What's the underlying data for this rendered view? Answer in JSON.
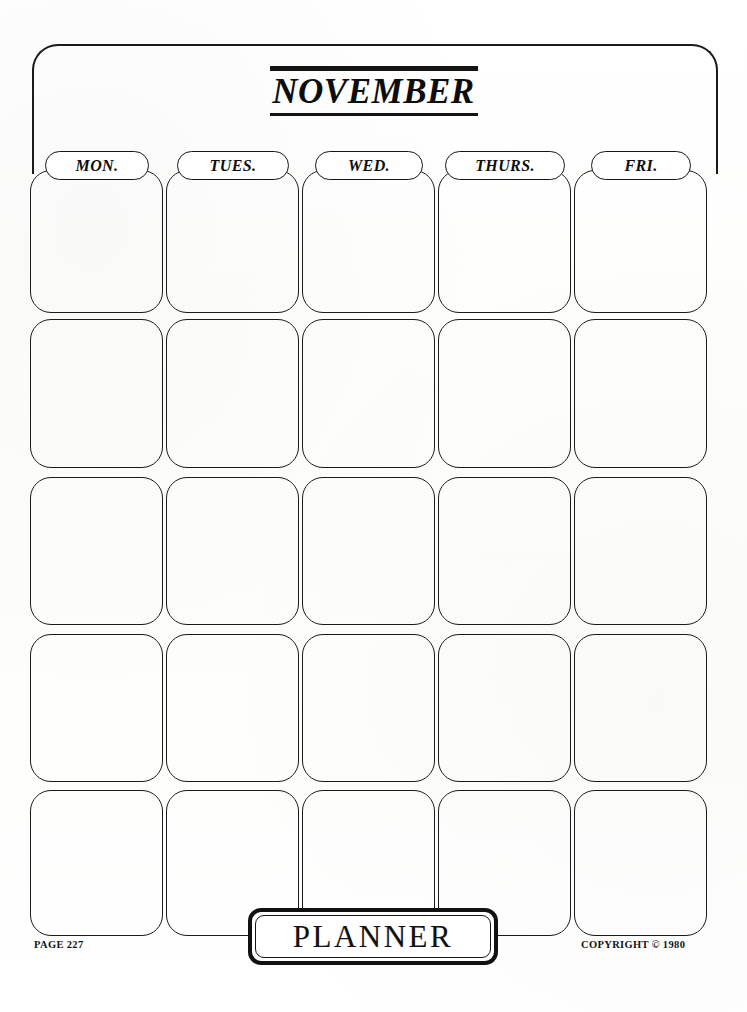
{
  "page": {
    "background_color": "#fdfdfc",
    "ink_color": "#141414"
  },
  "header": {
    "month_title": "NOVEMBER",
    "rule_above": true,
    "rule_below": true
  },
  "calendar": {
    "columns": [
      {
        "label": "MON.",
        "name": "monday"
      },
      {
        "label": "TUES.",
        "name": "tuesday"
      },
      {
        "label": "WED.",
        "name": "wednesday"
      },
      {
        "label": "THURS.",
        "name": "thursday"
      },
      {
        "label": "FRI.",
        "name": "friday"
      }
    ],
    "row_count": 5,
    "cells_are_blank": true
  },
  "footer": {
    "badge_label": "PLANNER",
    "page_number": "PAGE 227",
    "copyright": "COPYRIGHT © 1980"
  }
}
